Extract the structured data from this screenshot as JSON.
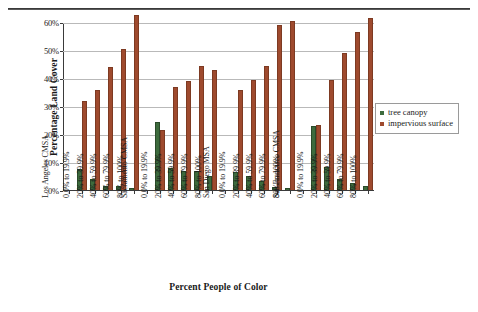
{
  "page": {
    "header_ghost_text": ""
  },
  "legend": {
    "position": "right",
    "entries": [
      {
        "label": "tree canopy",
        "color": "#3d6b3d",
        "icon": "square-marker"
      },
      {
        "label": "impervious surface",
        "color": "#9e4a2e",
        "icon": "square-marker"
      }
    ]
  },
  "axes": {
    "ylabel": "Percentage Land Cover",
    "xlabel": "Percent People of Color",
    "yticks": [
      "0%",
      "10%",
      "20%",
      "30%",
      "40%",
      "50%",
      "60%"
    ]
  },
  "chart_data": {
    "type": "bar",
    "title": "",
    "xlabel": "Percent People of Color",
    "ylabel": "Percentage Land Cover",
    "ylim": [
      0,
      60
    ],
    "ytick_values": [
      0,
      10,
      20,
      30,
      40,
      50,
      60
    ],
    "ytick_labels": [
      "0%",
      "10%",
      "20%",
      "30%",
      "40%",
      "50%",
      "60%"
    ],
    "grid": true,
    "legend_position": "right",
    "group_labels": [
      "Los Angeles CMSA",
      "Sacramento CMSA",
      "San Diego MSA",
      "San Francisco CMSA"
    ],
    "categories": [
      "0.0% to 19.9%",
      "20% to 39.9%",
      "40% to 59.9%",
      "60% to 79.9%",
      "80% to 100%"
    ],
    "series": [
      {
        "name": "tree canopy",
        "color": "#3d6b3d",
        "values": {
          "Los Angeles CMSA": [
            7.0,
            3.5,
            1.2,
            1.2,
            0.4
          ],
          "Sacramento CMSA": [
            24.0,
            7.5,
            6.5,
            6.5,
            4.5
          ],
          "San Diego MSA": [
            6.0,
            4.5,
            3.0,
            0.7,
            0.3
          ],
          "San Francisco CMSA": [
            22.5,
            8.0,
            3.5,
            2.0,
            1.0
          ]
        }
      },
      {
        "name": "impervious surface",
        "color": "#9e4a2e",
        "values": {
          "Los Angeles CMSA": [
            31.5,
            35.5,
            43.5,
            50.0,
            62.0
          ],
          "Sacramento CMSA": [
            21.0,
            36.5,
            38.5,
            44.0,
            42.5
          ],
          "San Diego MSA": [
            35.5,
            39.0,
            44.0,
            58.5,
            60.0
          ],
          "San Francisco CMSA": [
            23.0,
            39.0,
            48.5,
            56.0,
            61.0
          ]
        }
      }
    ]
  }
}
